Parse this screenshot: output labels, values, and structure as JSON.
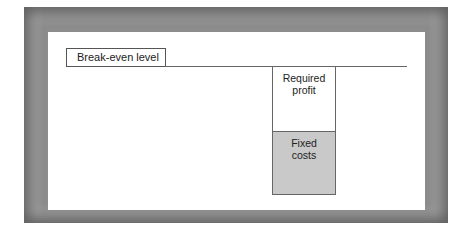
{
  "diagram": {
    "title_label": "Break-even level",
    "blocks": [
      {
        "line1": "Required",
        "line2": "profit",
        "fill": "#ffffff"
      },
      {
        "line1": "Fixed",
        "line2": "costs",
        "fill": "#c9c9c9"
      }
    ]
  },
  "colors": {
    "frame": "#8c8c8c",
    "panel": "#ffffff",
    "fixed_costs_fill": "#c9c9c9",
    "lines": "#666666"
  }
}
